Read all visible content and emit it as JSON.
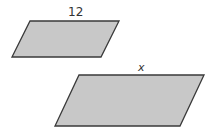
{
  "figure": {
    "small_parallelogram": {
      "top_label": "12",
      "fill": "#c8c8c8",
      "stroke": "#3a3a3a"
    },
    "large_parallelogram": {
      "top_label": "x",
      "fill": "#c8c8c8",
      "stroke": "#3a3a3a"
    }
  }
}
